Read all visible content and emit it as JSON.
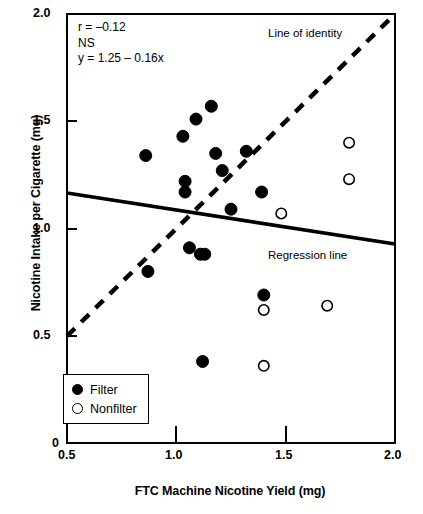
{
  "chart_data": {
    "type": "scatter",
    "title": "",
    "xlabel": "FTC Machine Nicotine Yield (mg)",
    "ylabel": "Nicotine Intake per Cigarette (mg)",
    "xlim": [
      0.5,
      2.0
    ],
    "ylim": [
      0.4,
      2.0
    ],
    "xticks": [
      "0.5",
      "1.0",
      "1.5",
      "2.0"
    ],
    "xtick_values": [
      0.5,
      1.0,
      1.5,
      2.0
    ],
    "yticks": [
      "0",
      "0.5",
      "1.0",
      "1.5",
      "2.0"
    ],
    "ytick_values": [
      0,
      0.5,
      1.0,
      1.5,
      2.0
    ],
    "y_axis_break": true,
    "grid": false,
    "legend_position": "bottom-left",
    "series": [
      {
        "name": "Filter",
        "marker": "filled-circle",
        "color": "#000000",
        "points": [
          [
            0.86,
            1.34
          ],
          [
            0.87,
            0.8
          ],
          [
            1.04,
            1.22
          ],
          [
            1.04,
            1.17
          ],
          [
            1.03,
            1.43
          ],
          [
            1.06,
            0.91
          ],
          [
            1.09,
            1.51
          ],
          [
            1.11,
            0.88
          ],
          [
            1.13,
            0.88
          ],
          [
            1.12,
            0.38
          ],
          [
            1.16,
            1.57
          ],
          [
            1.18,
            1.35
          ],
          [
            1.21,
            1.27
          ],
          [
            1.25,
            1.09
          ],
          [
            1.32,
            1.36
          ],
          [
            1.39,
            1.17
          ],
          [
            1.4,
            0.69
          ]
        ]
      },
      {
        "name": "Nonfilter",
        "marker": "open-circle",
        "color": "#000000",
        "points": [
          [
            1.4,
            0.62
          ],
          [
            1.4,
            0.36
          ],
          [
            1.48,
            1.07
          ],
          [
            1.69,
            0.64
          ],
          [
            1.79,
            1.4
          ],
          [
            1.79,
            1.23
          ]
        ]
      }
    ],
    "lines": [
      {
        "name": "Line of identity",
        "style": "dashed",
        "from": [
          0.5,
          0.5
        ],
        "to": [
          2.0,
          2.0
        ]
      },
      {
        "name": "Regression line",
        "style": "solid",
        "from": [
          0.5,
          1.17
        ],
        "to": [
          2.0,
          0.93
        ]
      }
    ],
    "annotations": {
      "correlation": "r = –0.12",
      "significance": "NS",
      "equation": "y = 1.25 – 0.16x",
      "identity_label": "Line of identity",
      "regression_label": "Regression line"
    }
  },
  "legend": {
    "items": [
      {
        "label": "Filter",
        "marker": "filled-circle"
      },
      {
        "label": "Nonfilter",
        "marker": "open-circle"
      }
    ]
  }
}
